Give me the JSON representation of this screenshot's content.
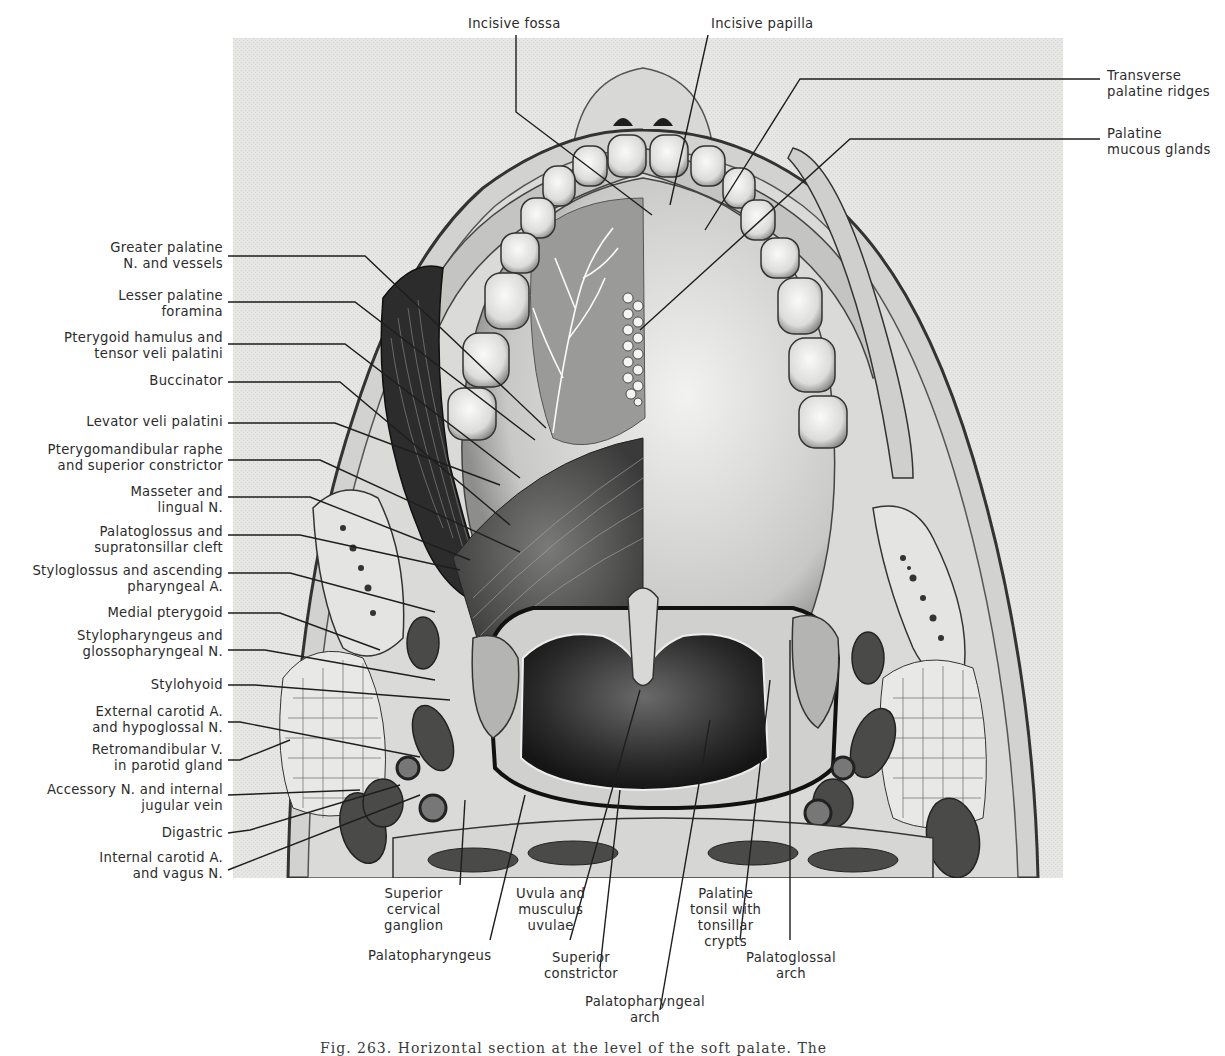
{
  "figure": {
    "caption_partial": "Fig. 263.  Horizontal section at the level of the soft palate. The",
    "background_color": "#e6e6e4",
    "ink_color": "#1e1e1e"
  },
  "labels": {
    "top": [
      {
        "id": "incisive-fossa",
        "text": "Incisive fossa"
      },
      {
        "id": "incisive-papilla",
        "text": "Incisive papilla"
      }
    ],
    "right": [
      {
        "id": "transverse-palatine-ridges",
        "text": "Transverse\npalatine ridges"
      },
      {
        "id": "palatine-mucous-glands",
        "text": "Palatine\nmucous glands"
      }
    ],
    "left": [
      {
        "id": "greater-palatine",
        "text": "Greater palatine\nN. and vessels"
      },
      {
        "id": "lesser-palatine",
        "text": "Lesser palatine\nforamina"
      },
      {
        "id": "pterygoid-hamulus",
        "text": "Pterygoid hamulus and\ntensor veli palatini"
      },
      {
        "id": "buccinator",
        "text": "Buccinator"
      },
      {
        "id": "levator-veli",
        "text": "Levator veli palatini"
      },
      {
        "id": "pterygomandibular",
        "text": "Pterygomandibular raphe\nand superior constrictor"
      },
      {
        "id": "masseter",
        "text": "Masseter and\nlingual N."
      },
      {
        "id": "palatoglossus",
        "text": "Palatoglossus and\nsupratonsillar cleft"
      },
      {
        "id": "styloglossus",
        "text": "Styloglossus and ascending\npharyngeal A."
      },
      {
        "id": "medial-pterygoid",
        "text": "Medial pterygoid"
      },
      {
        "id": "stylopharyngeus",
        "text": "Stylopharyngeus and\nglossopharyngeal N."
      },
      {
        "id": "stylohyoid",
        "text": "Stylohyoid"
      },
      {
        "id": "external-carotid",
        "text": "External carotid A.\nand hypoglossal N."
      },
      {
        "id": "retromandibular",
        "text": "Retromandibular V.\nin parotid gland"
      },
      {
        "id": "accessory-n",
        "text": "Accessory N. and internal\njugular vein"
      },
      {
        "id": "digastric",
        "text": "Digastric"
      },
      {
        "id": "internal-carotid",
        "text": "Internal carotid A.\nand vagus N."
      }
    ],
    "bottom": [
      {
        "id": "superior-cervical-ganglion",
        "text": "Superior\ncervical\nganglion"
      },
      {
        "id": "palatopharyngeus",
        "text": "Palatopharyngeus"
      },
      {
        "id": "uvula",
        "text": "Uvula and\nmusculus\nuvulae"
      },
      {
        "id": "superior-constrictor",
        "text": "Superior\nconstrictor"
      },
      {
        "id": "palatopharyngeal-arch",
        "text": "Palatopharyngeal\narch"
      },
      {
        "id": "palatine-tonsil",
        "text": "Palatine\ntonsil with\ntonsillar\ncrypts"
      },
      {
        "id": "palatoglossal-arch",
        "text": "Palatoglossal\narch"
      }
    ]
  }
}
